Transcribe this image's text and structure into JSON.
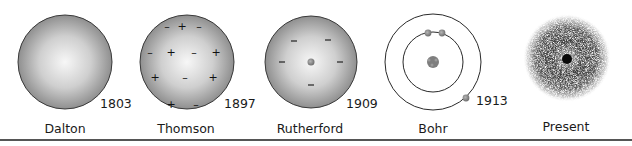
{
  "models": [
    {
      "name": "Dalton",
      "year": "1803",
      "description": "Solid uniform sphere"
    },
    {
      "name": "Thomson",
      "year": "1897",
      "description": "Plum pudding: sphere with embedded positive and negative charges",
      "charges": [
        "-",
        "+",
        "-",
        "-",
        "+",
        "-",
        "+",
        "+",
        "-",
        "+",
        "+",
        "-"
      ]
    },
    {
      "name": "Rutherford",
      "year": "1909",
      "description": "Small dense nucleus with electrons (negative charges) around it",
      "charges": [
        "-",
        "-",
        "-",
        "-",
        "-"
      ]
    },
    {
      "name": "Bohr",
      "year": "1913",
      "description": "Nucleus with electrons on two circular orbits",
      "orbits": 2,
      "electrons": 3
    },
    {
      "name": "Present",
      "year": "",
      "description": "Electron cloud model around a dense nucleus"
    }
  ],
  "colors": {
    "sphere_edge": "#3a3a3a",
    "sphere_center": "#f4f4f4",
    "sphere_outer": "#9a9a9a",
    "electron": "#8a8a8a",
    "cloud": "#222222",
    "rule": "#555555"
  }
}
